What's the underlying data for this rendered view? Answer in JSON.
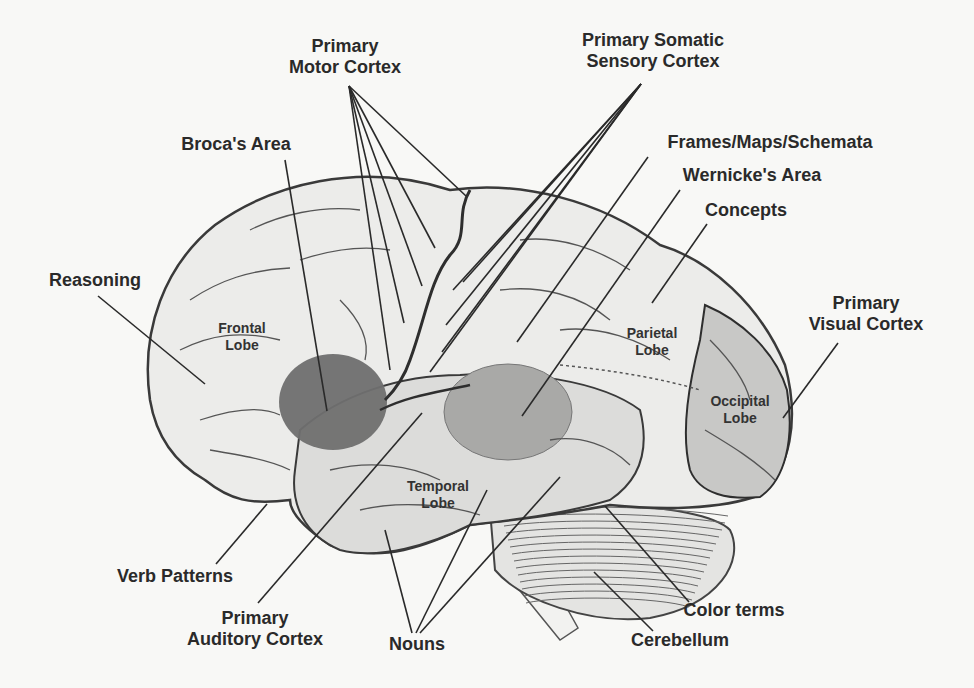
{
  "diagram": {
    "colors": {
      "background": "#f8f8f6",
      "brain_fill": "#ececea",
      "temporal_fill": "#dcdcda",
      "occipital_fill": "#c8c8c6",
      "broca_fill": "#6f6f6f",
      "wernicke_fill": "#a9a9a7",
      "outline": "#3c3c3c",
      "text": "#2a2a2a"
    },
    "labels": [
      {
        "id": "primary-motor-cortex",
        "line1": "Primary",
        "line2": "Motor Cortex",
        "x": 345,
        "y": 36
      },
      {
        "id": "primary-somatic-sensory-cortex",
        "line1": "Primary Somatic",
        "line2": "Sensory Cortex",
        "x": 653,
        "y": 30
      },
      {
        "id": "brocas-area",
        "line1": "Broca's Area",
        "line2": "",
        "x": 236,
        "y": 134
      },
      {
        "id": "frames-maps-schemata",
        "line1": "Frames/Maps/Schemata",
        "line2": "",
        "x": 770,
        "y": 132
      },
      {
        "id": "wernickes-area",
        "line1": "Wernicke's Area",
        "line2": "",
        "x": 752,
        "y": 165
      },
      {
        "id": "concepts",
        "line1": "Concepts",
        "line2": "",
        "x": 746,
        "y": 200
      },
      {
        "id": "reasoning",
        "line1": "Reasoning",
        "line2": "",
        "x": 95,
        "y": 270
      },
      {
        "id": "primary-visual-cortex",
        "line1": "Primary",
        "line2": "Visual Cortex",
        "x": 866,
        "y": 293
      },
      {
        "id": "verb-patterns",
        "line1": "Verb Patterns",
        "line2": "",
        "x": 175,
        "y": 566
      },
      {
        "id": "primary-auditory-cortex",
        "line1": "Primary",
        "line2": "Auditory Cortex",
        "x": 255,
        "y": 608
      },
      {
        "id": "nouns",
        "line1": "Nouns",
        "line2": "",
        "x": 417,
        "y": 634
      },
      {
        "id": "color-terms",
        "line1": "Color terms",
        "line2": "",
        "x": 734,
        "y": 600
      },
      {
        "id": "cerebellum",
        "line1": "Cerebellum",
        "line2": "",
        "x": 680,
        "y": 630
      }
    ],
    "lobes": [
      {
        "id": "frontal-lobe",
        "line1": "Frontal",
        "line2": "Lobe",
        "x": 242,
        "y": 320
      },
      {
        "id": "parietal-lobe",
        "line1": "Parietal",
        "line2": "Lobe",
        "x": 652,
        "y": 325
      },
      {
        "id": "temporal-lobe",
        "line1": "Temporal",
        "line2": "Lobe",
        "x": 438,
        "y": 478
      },
      {
        "id": "occipital-lobe",
        "line1": "Occipital",
        "line2": "Lobe",
        "x": 740,
        "y": 393
      }
    ],
    "leader_lines": [
      {
        "label": "primary-motor-cortex",
        "x1": 349,
        "y1": 86,
        "x2": 466,
        "y2": 196
      },
      {
        "label": "primary-motor-cortex",
        "x1": 349,
        "y1": 86,
        "x2": 435,
        "y2": 248
      },
      {
        "label": "primary-motor-cortex",
        "x1": 349,
        "y1": 86,
        "x2": 422,
        "y2": 286
      },
      {
        "label": "primary-motor-cortex",
        "x1": 349,
        "y1": 86,
        "x2": 404,
        "y2": 323
      },
      {
        "label": "primary-motor-cortex",
        "x1": 349,
        "y1": 86,
        "x2": 390,
        "y2": 370
      },
      {
        "label": "primary-somatic-sensory-cortex",
        "x1": 641,
        "y1": 84,
        "x2": 453,
        "y2": 290
      },
      {
        "label": "primary-somatic-sensory-cortex",
        "x1": 641,
        "y1": 84,
        "x2": 446,
        "y2": 325
      },
      {
        "label": "primary-somatic-sensory-cortex",
        "x1": 641,
        "y1": 84,
        "x2": 442,
        "y2": 352
      },
      {
        "label": "primary-somatic-sensory-cortex",
        "x1": 641,
        "y1": 84,
        "x2": 430,
        "y2": 372
      },
      {
        "label": "primary-somatic-sensory-cortex",
        "x1": 641,
        "y1": 84,
        "x2": 463,
        "y2": 282
      },
      {
        "label": "brocas-area",
        "x1": 285,
        "y1": 160,
        "x2": 327,
        "y2": 411
      },
      {
        "label": "frames-maps-schemata",
        "x1": 648,
        "y1": 157,
        "x2": 517,
        "y2": 342
      },
      {
        "label": "wernickes-area",
        "x1": 680,
        "y1": 190,
        "x2": 522,
        "y2": 416
      },
      {
        "label": "concepts",
        "x1": 707,
        "y1": 224,
        "x2": 652,
        "y2": 303
      },
      {
        "label": "reasoning",
        "x1": 98,
        "y1": 296,
        "x2": 205,
        "y2": 384
      },
      {
        "label": "primary-visual-cortex",
        "x1": 838,
        "y1": 343,
        "x2": 783,
        "y2": 418
      },
      {
        "label": "verb-patterns",
        "x1": 216,
        "y1": 564,
        "x2": 267,
        "y2": 504
      },
      {
        "label": "primary-auditory-cortex",
        "x1": 258,
        "y1": 603,
        "x2": 422,
        "y2": 413
      },
      {
        "label": "nouns",
        "x1": 412,
        "y1": 633,
        "x2": 385,
        "y2": 530
      },
      {
        "label": "nouns",
        "x1": 416,
        "y1": 633,
        "x2": 487,
        "y2": 490
      },
      {
        "label": "nouns",
        "x1": 420,
        "y1": 633,
        "x2": 560,
        "y2": 477
      },
      {
        "label": "color-terms",
        "x1": 689,
        "y1": 602,
        "x2": 605,
        "y2": 506
      },
      {
        "label": "cerebellum",
        "x1": 653,
        "y1": 631,
        "x2": 594,
        "y2": 572
      }
    ]
  }
}
